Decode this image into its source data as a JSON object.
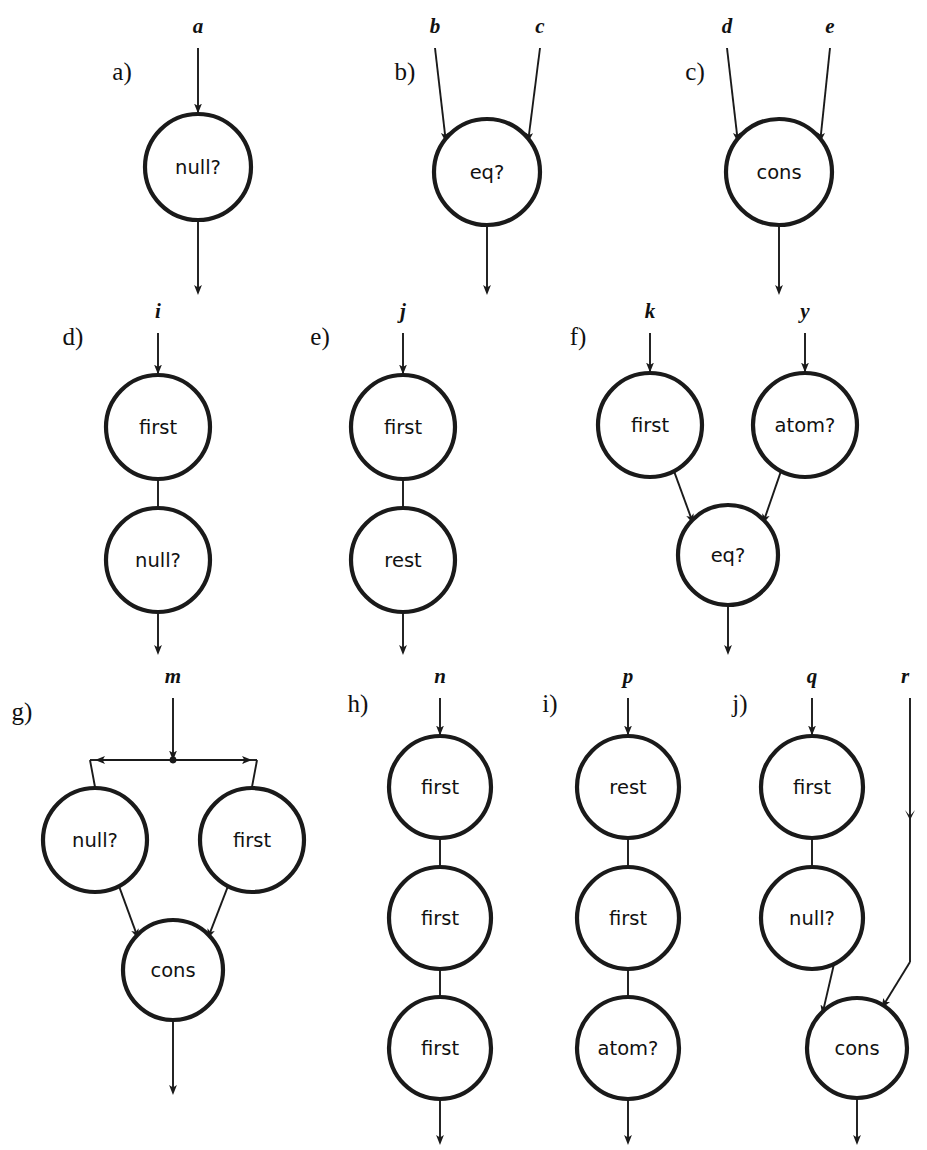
{
  "figure": {
    "background_color": "#ffffff",
    "ink_color": "#1a1a1a",
    "width": 927,
    "height": 1150
  },
  "panels": [
    {
      "id": "a",
      "label": "a)",
      "label_x": 122,
      "label_y": 80,
      "inputs": [
        {
          "name": "a",
          "x": 198,
          "y": 33
        }
      ],
      "nodes": [
        {
          "name": "null?",
          "cx": 198,
          "cy": 167,
          "r": 53
        }
      ],
      "output": {
        "x": 198,
        "y": 290
      }
    },
    {
      "id": "b",
      "label": "b)",
      "label_x": 405,
      "label_y": 80,
      "inputs": [
        {
          "name": "b",
          "x": 435,
          "y": 33
        },
        {
          "name": "c",
          "x": 540,
          "y": 33
        }
      ],
      "nodes": [
        {
          "name": "eq?",
          "cx": 487,
          "cy": 172,
          "r": 53
        }
      ],
      "output": {
        "x": 487,
        "y": 290
      }
    },
    {
      "id": "c",
      "label": "c)",
      "label_x": 695,
      "label_y": 80,
      "inputs": [
        {
          "name": "d",
          "x": 727,
          "y": 33
        },
        {
          "name": "e",
          "x": 830,
          "y": 33
        }
      ],
      "nodes": [
        {
          "name": "cons",
          "cx": 779,
          "cy": 172,
          "r": 53
        }
      ],
      "output": {
        "x": 779,
        "y": 290
      }
    },
    {
      "id": "d",
      "label": "d)",
      "label_x": 73,
      "label_y": 345,
      "inputs": [
        {
          "name": "i",
          "x": 158,
          "y": 318
        }
      ],
      "nodes": [
        {
          "name": "first",
          "cx": 158,
          "cy": 427,
          "r": 52
        },
        {
          "name": "null?",
          "cx": 158,
          "cy": 560,
          "r": 52
        }
      ],
      "output": {
        "x": 158,
        "y": 650
      }
    },
    {
      "id": "e",
      "label": "e)",
      "label_x": 320,
      "label_y": 345,
      "inputs": [
        {
          "name": "j",
          "x": 403,
          "y": 318
        }
      ],
      "nodes": [
        {
          "name": "first",
          "cx": 403,
          "cy": 427,
          "r": 52
        },
        {
          "name": "rest",
          "cx": 403,
          "cy": 560,
          "r": 52
        }
      ],
      "output": {
        "x": 403,
        "y": 650
      }
    },
    {
      "id": "f",
      "label": "f)",
      "label_x": 578,
      "label_y": 345,
      "inputs": [
        {
          "name": "k",
          "x": 650,
          "y": 318
        },
        {
          "name": "y",
          "x": 805,
          "y": 318
        }
      ],
      "nodes": [
        {
          "name": "first",
          "cx": 650,
          "cy": 425,
          "r": 52
        },
        {
          "name": "atom?",
          "cx": 805,
          "cy": 425,
          "r": 52
        },
        {
          "name": "eq?",
          "cx": 728,
          "cy": 555,
          "r": 50
        }
      ],
      "output": {
        "x": 728,
        "y": 650
      }
    },
    {
      "id": "g",
      "label": "g)",
      "label_x": 22,
      "label_y": 720,
      "inputs": [
        {
          "name": "m",
          "x": 173,
          "y": 683
        }
      ],
      "nodes": [
        {
          "name": "null?",
          "cx": 95,
          "cy": 840,
          "r": 52
        },
        {
          "name": "first",
          "cx": 252,
          "cy": 840,
          "r": 52
        },
        {
          "name": "cons",
          "cx": 173,
          "cy": 970,
          "r": 50
        }
      ],
      "fanout": {
        "x": 173,
        "y": 760,
        "left_x": 90,
        "right_x": 257
      },
      "output": {
        "x": 173,
        "y": 1090
      }
    },
    {
      "id": "h",
      "label": "h)",
      "label_x": 358,
      "label_y": 712,
      "inputs": [
        {
          "name": "n",
          "x": 440,
          "y": 683
        }
      ],
      "nodes": [
        {
          "name": "first",
          "cx": 440,
          "cy": 787,
          "r": 51
        },
        {
          "name": "first",
          "cx": 440,
          "cy": 918,
          "r": 51
        },
        {
          "name": "first",
          "cx": 440,
          "cy": 1048,
          "r": 51
        }
      ],
      "output": {
        "x": 440,
        "y": 1140
      }
    },
    {
      "id": "i",
      "label": "i)",
      "label_x": 550,
      "label_y": 712,
      "inputs": [
        {
          "name": "p",
          "x": 628,
          "y": 683
        }
      ],
      "nodes": [
        {
          "name": "rest",
          "cx": 628,
          "cy": 787,
          "r": 51
        },
        {
          "name": "first",
          "cx": 628,
          "cy": 918,
          "r": 51
        },
        {
          "name": "atom?",
          "cx": 628,
          "cy": 1048,
          "r": 51
        }
      ],
      "output": {
        "x": 628,
        "y": 1140
      }
    },
    {
      "id": "j",
      "label": "j)",
      "label_x": 740,
      "label_y": 712,
      "inputs": [
        {
          "name": "q",
          "x": 812,
          "y": 683
        },
        {
          "name": "r",
          "x": 905,
          "y": 683
        }
      ],
      "nodes": [
        {
          "name": "first",
          "cx": 812,
          "cy": 787,
          "r": 51
        },
        {
          "name": "null?",
          "cx": 812,
          "cy": 918,
          "r": 51
        },
        {
          "name": "cons",
          "cx": 857,
          "cy": 1048,
          "r": 50
        }
      ],
      "bypass": {
        "x": 910,
        "top_y": 690,
        "bend_y": 962,
        "mid_arrow_y": 820
      },
      "output": {
        "x": 857,
        "y": 1140
      }
    }
  ],
  "node_names": [
    "null?",
    "eq?",
    "cons",
    "first",
    "rest",
    "atom?"
  ],
  "variable_names": [
    "a",
    "b",
    "c",
    "d",
    "e",
    "i",
    "j",
    "k",
    "y",
    "m",
    "n",
    "p",
    "q",
    "r"
  ],
  "panel_labels": [
    "a)",
    "b)",
    "c)",
    "d)",
    "e)",
    "f)",
    "g)",
    "h)",
    "i)",
    "j)"
  ]
}
